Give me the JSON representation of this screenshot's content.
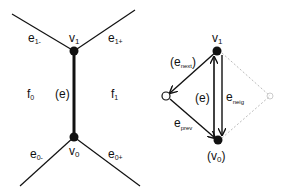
{
  "left_diagram": {
    "vertices": {
      "v1": {
        "label": "v",
        "sub": "1"
      },
      "v0": {
        "label": "v",
        "sub": "0"
      }
    },
    "edges": {
      "e1_minus": {
        "label": "e",
        "sub": "1-"
      },
      "e1_plus": {
        "label": "e",
        "sub": "1+"
      },
      "e0_minus": {
        "label": "e",
        "sub": "0-"
      },
      "e0_plus": {
        "label": "e",
        "sub": "0+"
      },
      "e": {
        "label": "(e)"
      }
    },
    "faces": {
      "f0": {
        "label": "f",
        "sub": "0"
      },
      "f1": {
        "label": "f",
        "sub": "1"
      }
    }
  },
  "right_diagram": {
    "vertices": {
      "v1": {
        "label": "v",
        "sub": "1"
      },
      "v0": {
        "label": "(v",
        "sub": "0",
        "close": ")"
      }
    },
    "edges": {
      "e": {
        "label": "(e)"
      },
      "e_next": {
        "open": "(e",
        "sub": "next",
        "close": ")"
      },
      "e_prev": {
        "label": "e",
        "sub": "prev"
      },
      "e_neig": {
        "label": "e",
        "sub": "neig"
      }
    }
  },
  "colors": {
    "ink": "#111111",
    "ghost": "#bbbbbb",
    "background": "#ffffff"
  }
}
